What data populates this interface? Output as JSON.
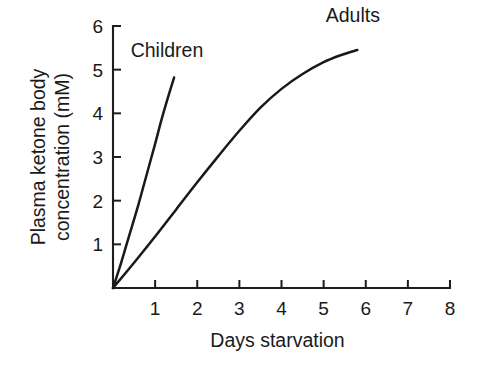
{
  "chart_data": {
    "type": "line",
    "title": "",
    "subtitle": "",
    "xlabel": "Days starvation",
    "ylabel": "Plasma ketone body concentration (mM)",
    "ylabel_line1": "Plasma ketone body",
    "ylabel_line2": "concentration (mM)",
    "xlim": [
      0,
      8
    ],
    "ylim": [
      0,
      6
    ],
    "xticks": [
      0,
      1,
      2,
      3,
      4,
      5,
      6,
      7,
      8
    ],
    "yticks": [
      0,
      1,
      2,
      3,
      4,
      5,
      6
    ],
    "xticklabels": [
      "",
      "1",
      "2",
      "3",
      "4",
      "5",
      "6",
      "7",
      "8"
    ],
    "yticklabels": [
      "",
      "1",
      "2",
      "3",
      "4",
      "5",
      "6"
    ],
    "grid": false,
    "legend": "inline-annotations",
    "line_color": "#191919",
    "axis_color": "#1d1d1d",
    "background": "#ffffff",
    "series": [
      {
        "name": "Children",
        "label": "Children",
        "label_x": 0.42,
        "label_y": 5.42,
        "points": [
          [
            0.0,
            0.0
          ],
          [
            0.2,
            0.6
          ],
          [
            0.4,
            1.25
          ],
          [
            0.6,
            1.9
          ],
          [
            0.8,
            2.6
          ],
          [
            1.0,
            3.3
          ],
          [
            1.15,
            3.85
          ],
          [
            1.3,
            4.35
          ],
          [
            1.45,
            4.82
          ]
        ]
      },
      {
        "name": "Adults",
        "label": "Adults",
        "label_x": 5.05,
        "label_y": 6.22,
        "points": [
          [
            0.0,
            0.0
          ],
          [
            0.5,
            0.58
          ],
          [
            1.0,
            1.18
          ],
          [
            1.5,
            1.8
          ],
          [
            2.0,
            2.42
          ],
          [
            2.5,
            3.02
          ],
          [
            3.0,
            3.6
          ],
          [
            3.5,
            4.13
          ],
          [
            4.0,
            4.56
          ],
          [
            4.5,
            4.9
          ],
          [
            5.0,
            5.17
          ],
          [
            5.4,
            5.33
          ],
          [
            5.8,
            5.45
          ]
        ]
      }
    ],
    "annotations": [
      {
        "text": "Children",
        "x": 0.42,
        "y": 5.42
      },
      {
        "text": "Adults",
        "x": 5.05,
        "y": 6.22
      }
    ]
  }
}
